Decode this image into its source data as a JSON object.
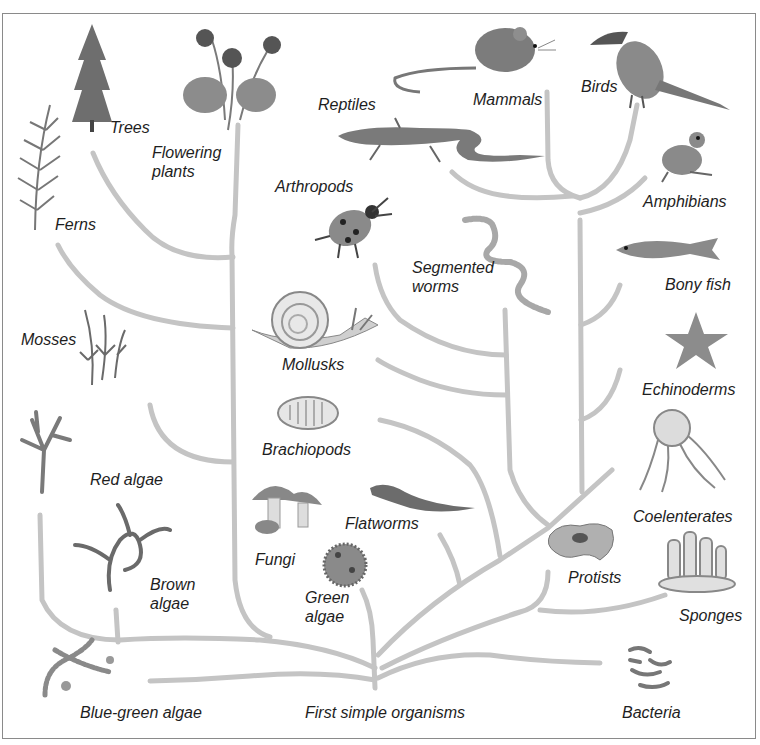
{
  "diagram": {
    "root_label": "First simple organisms",
    "branch_color": "#c4c4c4",
    "text_color": "#1e1e1e",
    "groups": [
      {
        "id": "trees",
        "label": "Trees",
        "icon": "conifer-tree-icon"
      },
      {
        "id": "flowering_plants",
        "label": "Flowering\nplants",
        "icon": "violet-flower-icon"
      },
      {
        "id": "ferns",
        "label": "Ferns",
        "icon": "fern-frond-icon"
      },
      {
        "id": "mosses",
        "label": "Mosses",
        "icon": "moss-icon"
      },
      {
        "id": "red_algae",
        "label": "Red algae",
        "icon": "red-algae-icon"
      },
      {
        "id": "brown_algae",
        "label": "Brown\nalgae",
        "icon": "brown-algae-icon"
      },
      {
        "id": "blue_green_algae",
        "label": "Blue-green algae",
        "icon": "blue-green-algae-icon"
      },
      {
        "id": "fungi",
        "label": "Fungi",
        "icon": "mushroom-icon"
      },
      {
        "id": "green_algae",
        "label": "Green\nalgae",
        "icon": "green-algae-sphere-icon"
      },
      {
        "id": "brachiopods",
        "label": "Brachiopods",
        "icon": "brachiopod-shell-icon"
      },
      {
        "id": "mollusks",
        "label": "Mollusks",
        "icon": "snail-icon"
      },
      {
        "id": "arthropods",
        "label": "Arthropods",
        "icon": "ladybug-icon"
      },
      {
        "id": "reptiles",
        "label": "Reptiles",
        "icon": "lizard-icon"
      },
      {
        "id": "mammals",
        "label": "Mammals",
        "icon": "mouse-icon"
      },
      {
        "id": "birds",
        "label": "Birds",
        "icon": "toucan-bird-icon"
      },
      {
        "id": "amphibians",
        "label": "Amphibians",
        "icon": "frog-icon"
      },
      {
        "id": "bony_fish",
        "label": "Bony fish",
        "icon": "fish-icon"
      },
      {
        "id": "segmented_worms",
        "label": "Segmented\nworms",
        "icon": "segmented-worm-icon"
      },
      {
        "id": "flatworms",
        "label": "Flatworms",
        "icon": "flatworm-icon"
      },
      {
        "id": "echinoderms",
        "label": "Echinoderms",
        "icon": "starfish-icon"
      },
      {
        "id": "coelenterates",
        "label": "Coelenterates",
        "icon": "jellyfish-icon"
      },
      {
        "id": "protists",
        "label": "Protists",
        "icon": "amoeba-icon"
      },
      {
        "id": "sponges",
        "label": "Sponges",
        "icon": "sponge-icon"
      },
      {
        "id": "bacteria",
        "label": "Bacteria",
        "icon": "bacteria-icon"
      }
    ]
  }
}
